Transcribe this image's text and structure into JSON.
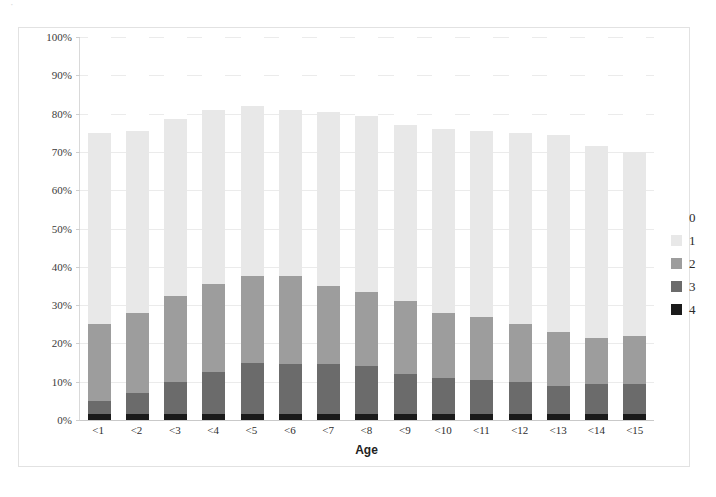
{
  "scan": {
    "top_sliver_text": "·"
  },
  "chart_data": {
    "type": "bar",
    "subtype": "stacked-percent",
    "title": "",
    "xlabel": "Age",
    "ylabel": "",
    "ylim": [
      0,
      100
    ],
    "yticks": [
      "0%",
      "10%",
      "20%",
      "30%",
      "40%",
      "50%",
      "60%",
      "70%",
      "80%",
      "90%",
      "100%"
    ],
    "ytick_values": [
      0,
      10,
      20,
      30,
      40,
      50,
      60,
      70,
      80,
      90,
      100
    ],
    "grid": true,
    "legend_position": "right",
    "categories": [
      "<1",
      "<2",
      "<3",
      "<4",
      "<5",
      "<6",
      "<7",
      "<8",
      "<9",
      "<10",
      "<11",
      "<12",
      "<13",
      "<14",
      "<15"
    ],
    "series": [
      {
        "name": "4",
        "color": "#1a1a1a",
        "values": [
          1.5,
          1.5,
          1.5,
          1.5,
          1.5,
          1.5,
          1.5,
          1.5,
          1.5,
          1.5,
          1.5,
          1.5,
          1.5,
          1.5,
          1.5
        ]
      },
      {
        "name": "3",
        "color": "#6b6b6b",
        "values": [
          3.5,
          5.5,
          8.5,
          11.0,
          13.5,
          13.0,
          13.0,
          12.5,
          10.5,
          9.5,
          9.0,
          8.5,
          7.5,
          8.0,
          8.0
        ]
      },
      {
        "name": "2",
        "color": "#9d9d9d",
        "values": [
          20.0,
          21.0,
          22.5,
          23.0,
          22.5,
          23.0,
          20.5,
          19.5,
          19.0,
          17.0,
          16.5,
          15.0,
          14.0,
          12.0,
          12.5
        ]
      },
      {
        "name": "1",
        "color": "#e8e8e8",
        "values": [
          50.0,
          47.5,
          46.0,
          45.5,
          44.5,
          43.5,
          45.5,
          46.0,
          46.0,
          48.0,
          48.5,
          50.0,
          51.5,
          50.0,
          48.0
        ]
      },
      {
        "name": "0",
        "color": "#ffffff",
        "values": [
          25.0,
          24.5,
          21.5,
          19.0,
          18.0,
          19.0,
          19.5,
          20.5,
          23.0,
          24.0,
          24.5,
          25.0,
          25.5,
          28.5,
          30.0
        ]
      }
    ],
    "legend": [
      {
        "label": "0",
        "color": "#ffffff"
      },
      {
        "label": "1",
        "color": "#e8e8e8"
      },
      {
        "label": "2",
        "color": "#9d9d9d"
      },
      {
        "label": "3",
        "color": "#6b6b6b"
      },
      {
        "label": "4",
        "color": "#1a1a1a"
      }
    ]
  }
}
